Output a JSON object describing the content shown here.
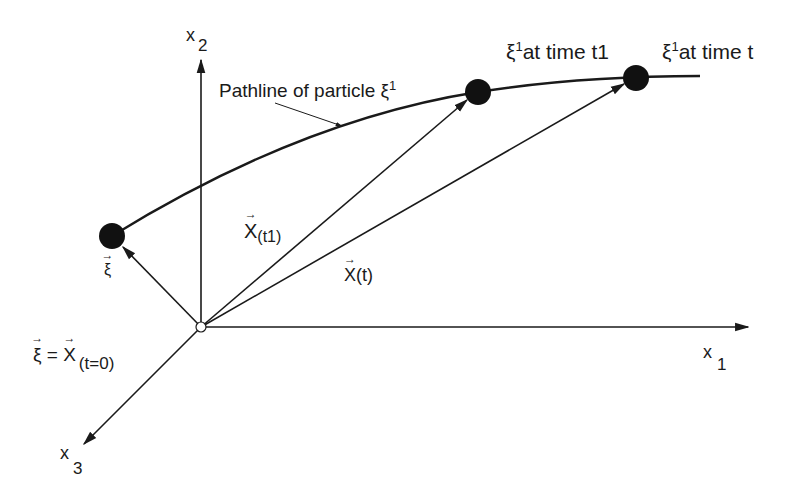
{
  "diagram": {
    "axes": [
      {
        "name": "x1",
        "base": "x",
        "sub": "1"
      },
      {
        "name": "x2",
        "base": "x",
        "sub": "2"
      },
      {
        "name": "x3",
        "base": "x",
        "sub": "3"
      }
    ],
    "labels": {
      "pathline_text": "Pathline of particle ",
      "xi": "ξ",
      "sup1": "1",
      "t1_text": "at time t1",
      "t_text": "at time t",
      "X": "X",
      "t1_sub": "(t1)",
      "t_sub": "(t)",
      "eq": " = ",
      "t0_sub": "(t=0)"
    },
    "colors": {
      "stroke": "#1a1a1a",
      "background": "#ffffff"
    }
  }
}
